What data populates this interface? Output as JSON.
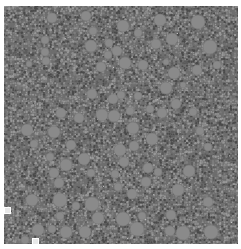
{
  "image": {
    "description": "Grayscale micrograph-like packing of circular particles of varying size",
    "width": 241,
    "height": 249,
    "panel": {
      "x": 4,
      "y": 6,
      "width": 234,
      "height": 238
    },
    "colors": {
      "background": "#ffffff",
      "matrix_dark": "#4a4a4a",
      "matrix_mid": "#6e6e6e",
      "matrix_light": "#8c8c8c",
      "large_particle": "#8a8a8a",
      "large_particle_edge": "#7a7a7a",
      "speck": "#d8d8d8"
    }
  },
  "markers": [
    {
      "x": 6,
      "y": 209
    },
    {
      "x": 34,
      "y": 240
    }
  ],
  "large_particles": [
    [
      52,
      18,
      5
    ],
    [
      86,
      16,
      5
    ],
    [
      123,
      26,
      6
    ],
    [
      160,
      20,
      6
    ],
    [
      198,
      22,
      7
    ],
    [
      93,
      31,
      4
    ],
    [
      45,
      40,
      4
    ],
    [
      91,
      46,
      6
    ],
    [
      109,
      43,
      4
    ],
    [
      117,
      51,
      5
    ],
    [
      108,
      55,
      4
    ],
    [
      156,
      44,
      5
    ],
    [
      172,
      39,
      6
    ],
    [
      210,
      47,
      7
    ],
    [
      138,
      33,
      4
    ],
    [
      45,
      52,
      4
    ],
    [
      46,
      61,
      4
    ],
    [
      29,
      64,
      3
    ],
    [
      125,
      63,
      6
    ],
    [
      143,
      65,
      5
    ],
    [
      101,
      67,
      5
    ],
    [
      197,
      70,
      5
    ],
    [
      217,
      65,
      4
    ],
    [
      174,
      73,
      6
    ],
    [
      166,
      62,
      3
    ],
    [
      92,
      94,
      5
    ],
    [
      113,
      99,
      5
    ],
    [
      121,
      95,
      4
    ],
    [
      138,
      96,
      4
    ],
    [
      166,
      88,
      6
    ],
    [
      183,
      85,
      3
    ],
    [
      176,
      104,
      5
    ],
    [
      61,
      113,
      5
    ],
    [
      79,
      118,
      5
    ],
    [
      102,
      115,
      6
    ],
    [
      114,
      116,
      6
    ],
    [
      130,
      111,
      4
    ],
    [
      150,
      109,
      4
    ],
    [
      162,
      113,
      5
    ],
    [
      193,
      112,
      4
    ],
    [
      27,
      130,
      6
    ],
    [
      54,
      132,
      6
    ],
    [
      133,
      128,
      6
    ],
    [
      200,
      131,
      4
    ],
    [
      34,
      144,
      4
    ],
    [
      71,
      145,
      5
    ],
    [
      152,
      139,
      6
    ],
    [
      134,
      146,
      5
    ],
    [
      208,
      147,
      4
    ],
    [
      120,
      150,
      6
    ],
    [
      50,
      157,
      4
    ],
    [
      84,
      159,
      6
    ],
    [
      124,
      162,
      5
    ],
    [
      66,
      165,
      6
    ],
    [
      148,
      168,
      5
    ],
    [
      189,
      171,
      6
    ],
    [
      54,
      173,
      5
    ],
    [
      91,
      173,
      4
    ],
    [
      115,
      174,
      4
    ],
    [
      158,
      172,
      4
    ],
    [
      59,
      183,
      5
    ],
    [
      146,
      182,
      5
    ],
    [
      118,
      187,
      4
    ],
    [
      132,
      194,
      5
    ],
    [
      178,
      190,
      6
    ],
    [
      32,
      200,
      6
    ],
    [
      60,
      200,
      7
    ],
    [
      76,
      206,
      4
    ],
    [
      92,
      204,
      7
    ],
    [
      208,
      202,
      5
    ],
    [
      60,
      216,
      4
    ],
    [
      98,
      218,
      6
    ],
    [
      123,
      219,
      7
    ],
    [
      142,
      216,
      4
    ],
    [
      171,
      215,
      5
    ],
    [
      38,
      230,
      6
    ],
    [
      52,
      229,
      4
    ],
    [
      66,
      232,
      6
    ],
    [
      85,
      232,
      6
    ],
    [
      137,
      229,
      7
    ],
    [
      170,
      231,
      5
    ],
    [
      183,
      233,
      7
    ],
    [
      211,
      232,
      7
    ],
    [
      25,
      240,
      4
    ]
  ]
}
